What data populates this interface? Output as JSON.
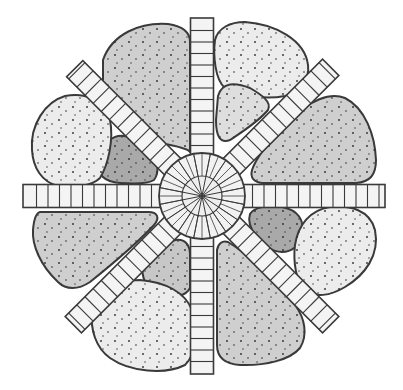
{
  "diagram": {
    "title": "Radial garden bed plan",
    "center": {
      "x": 202,
      "y": 196,
      "outer_radius": 43,
      "inner_radius": 20,
      "radial_divisions": 16
    },
    "colors": {
      "background": "#ffffff",
      "outline": "#3a3a3a",
      "paver": "#f4f4f4",
      "bed_light": "#ececec",
      "bed_medium": "#cfcfcf",
      "bed_dark": "#a9a9a9",
      "stipple": "#2a2a2a"
    },
    "paths": [
      {
        "name": "north",
        "angle": -90,
        "length": 178
      },
      {
        "name": "south",
        "angle": 90,
        "length": 178
      },
      {
        "name": "west",
        "angle": 180,
        "length": 179
      },
      {
        "name": "east",
        "angle": 0,
        "length": 183
      },
      {
        "name": "northwest",
        "angle": -135,
        "length": 180
      },
      {
        "name": "northeast",
        "angle": -45,
        "length": 182
      },
      {
        "name": "southwest",
        "angle": 135,
        "length": 182
      },
      {
        "name": "southeast",
        "angle": 45,
        "length": 182
      }
    ],
    "beds": [
      {
        "name": "north-left-large",
        "shade": "medium"
      },
      {
        "name": "north-right-large",
        "shade": "light"
      },
      {
        "name": "north-right-small",
        "shade": "light"
      },
      {
        "name": "east-upper-large",
        "shade": "medium"
      },
      {
        "name": "east-lower-small",
        "shade": "dark"
      },
      {
        "name": "east-lower-large",
        "shade": "light"
      },
      {
        "name": "south-right-large",
        "shade": "medium"
      },
      {
        "name": "south-left-small",
        "shade": "medium"
      },
      {
        "name": "south-left-large",
        "shade": "light"
      },
      {
        "name": "west-lower-large",
        "shade": "medium"
      },
      {
        "name": "west-upper-small",
        "shade": "dark"
      },
      {
        "name": "west-upper-large",
        "shade": "light"
      }
    ]
  }
}
